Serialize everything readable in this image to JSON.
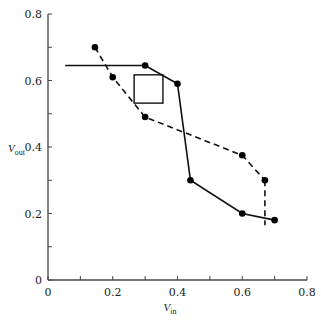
{
  "chart_data": {
    "type": "line",
    "title": "",
    "xlabel": "V_in",
    "ylabel": "V_out",
    "xlabel_main": "V",
    "xlabel_sub": "in",
    "ylabel_main": "V",
    "ylabel_sub": "out",
    "xlim": [
      0,
      0.8
    ],
    "ylim": [
      0,
      0.8
    ],
    "grid": false,
    "legend": null,
    "x_ticks": [
      0,
      0.2,
      0.4,
      0.6,
      0.8
    ],
    "x_tick_labels": [
      "0",
      "0.2",
      "0.4",
      "0.6",
      "0.8"
    ],
    "x_minor_ticks": [
      0.1,
      0.3,
      0.5,
      0.7
    ],
    "y_ticks": [
      0,
      0.2,
      0.4,
      0.6,
      0.8
    ],
    "y_tick_labels": [
      "0",
      "0.2",
      "0.4",
      "0.6",
      "0.8"
    ],
    "y_minor_ticks": [
      0.1,
      0.3,
      0.5,
      0.7
    ],
    "series": [
      {
        "name": "solid",
        "style": "solid",
        "leading_segment": {
          "x": [
            0.053,
            0.3
          ],
          "y": [
            0.645,
            0.645
          ]
        },
        "x": [
          0.3,
          0.4,
          0.44,
          0.6,
          0.7
        ],
        "y": [
          0.645,
          0.59,
          0.3,
          0.2,
          0.18
        ]
      },
      {
        "name": "dashed",
        "style": "dashed",
        "x": [
          0.145,
          0.2,
          0.3,
          0.6,
          0.67
        ],
        "y": [
          0.7,
          0.61,
          0.49,
          0.375,
          0.3
        ],
        "trailing_segment": {
          "x": [
            0.67,
            0.67
          ],
          "y": [
            0.3,
            0.165
          ]
        }
      }
    ],
    "annotations": [
      {
        "type": "square",
        "x0": 0.266,
        "x1": 0.355,
        "y0": 0.532,
        "y1": 0.617
      }
    ]
  }
}
